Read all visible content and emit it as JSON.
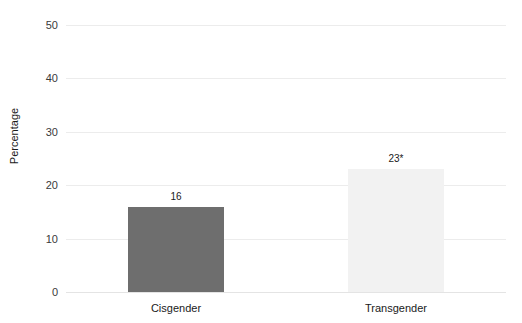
{
  "chart_data": {
    "type": "bar",
    "title": "",
    "xlabel": "",
    "ylabel": "Percentage",
    "categories": [
      "Cisgender",
      "Transgender"
    ],
    "values": [
      16,
      23
    ],
    "value_labels": [
      "16",
      "23*"
    ],
    "bar_colors": [
      "#6e6e6e",
      "#f2f2f2"
    ],
    "ylim": [
      0,
      50
    ],
    "yticks": [
      "0",
      "10",
      "20",
      "30",
      "40",
      "50"
    ],
    "ytick_values": [
      0,
      10,
      20,
      30,
      40,
      50
    ],
    "grid": true,
    "legend": "none",
    "annotations": [
      "* denotes statistical significance"
    ]
  }
}
